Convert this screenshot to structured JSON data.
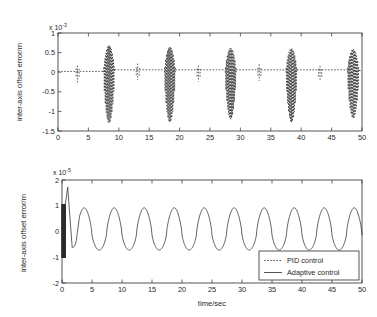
{
  "figure": {
    "background_color": "#ffffff",
    "line_color": "#2b2b2b",
    "xlabel": "time/sec"
  },
  "chart_data": [
    {
      "type": "line",
      "id": "top-subplot",
      "title": "",
      "xlabel": "",
      "ylabel": "inter-axis offset error/m",
      "y_multiplier_text": "x 10",
      "y_multiplier_exponent": "-3",
      "y_multiplier_value": 0.001,
      "xlim": [
        0,
        50
      ],
      "ylim": [
        -1.5,
        1
      ],
      "xticks": [
        0,
        5,
        10,
        15,
        20,
        25,
        30,
        35,
        40,
        45,
        50
      ],
      "xticklabels": [
        "0",
        "5",
        "10",
        "15",
        "20",
        "25",
        "30",
        "35",
        "40",
        "45",
        "50"
      ],
      "yticks": [
        1,
        0.5,
        0,
        -0.5,
        -1,
        -1.5
      ],
      "yticklabels": [
        "1",
        "0.5",
        "0",
        "-0.5",
        "-1",
        "-1.5"
      ],
      "grid": false,
      "legend": "none",
      "series": [
        {
          "name": "PID control",
          "style": "dotted",
          "description": "Near-zero dotted baseline punctuated by five large dense oscillatory bursts and five small spikes",
          "baseline": 0.02,
          "small_spikes": [
            {
              "center": 3.2,
              "half_width": 0.45,
              "top": 0.17,
              "bottom": -0.26
            },
            {
              "center": 13.1,
              "half_width": 0.45,
              "top": 0.22,
              "bottom": -0.2
            },
            {
              "center": 23.1,
              "half_width": 0.45,
              "top": 0.17,
              "bottom": -0.24
            },
            {
              "center": 33.1,
              "half_width": 0.45,
              "top": 0.2,
              "bottom": -0.22
            },
            {
              "center": 43.1,
              "half_width": 0.45,
              "top": 0.16,
              "bottom": -0.23
            }
          ],
          "bursts": [
            {
              "start": 7.5,
              "end": 9.3,
              "peak": 0.7,
              "trough": -1.3,
              "step_after": 0.06
            },
            {
              "start": 17.5,
              "end": 19.3,
              "peak": 0.66,
              "trough": -1.28,
              "step_after": 0.06
            },
            {
              "start": 27.5,
              "end": 29.3,
              "peak": 0.63,
              "trough": -1.2,
              "step_after": 0.06
            },
            {
              "start": 37.5,
              "end": 39.3,
              "peak": 0.62,
              "trough": -1.28,
              "step_after": 0.06
            },
            {
              "start": 47.6,
              "end": 49.5,
              "peak": 0.6,
              "trough": -1.18,
              "step_after": 0.04
            }
          ]
        }
      ]
    },
    {
      "type": "line",
      "id": "bottom-subplot",
      "title": "",
      "xlabel": "time/sec",
      "ylabel": "inter-axis offset error/m",
      "y_multiplier_text": "x 10",
      "y_multiplier_exponent": "-5",
      "y_multiplier_value": 1e-05,
      "xlim": [
        0,
        50
      ],
      "ylim": [
        -2,
        2
      ],
      "xticks": [
        0,
        5,
        10,
        15,
        20,
        25,
        30,
        35,
        40,
        45,
        50
      ],
      "xticklabels": [
        "0",
        "5",
        "10",
        "15",
        "20",
        "25",
        "30",
        "35",
        "40",
        "45",
        "50"
      ],
      "yticks": [
        2,
        1,
        0,
        -1,
        -2
      ],
      "yticklabels": [
        "2",
        "1",
        "0",
        "-1",
        "-2"
      ],
      "grid": false,
      "legend": "lower-right",
      "series": [
        {
          "name": "Adaptive control",
          "style": "solid",
          "description": "Fast initial transient chatter then decaying into a steady periodic oscillation of about 5 second period",
          "transient": {
            "chatter_end": 0.55,
            "chatter_top": 1.05,
            "chatter_bottom": -1.02,
            "overshoot_time": 0.95,
            "overshoot_value": 1.72,
            "undershoot_time": 1.7,
            "undershoot_value": -0.62
          },
          "steady": {
            "period": 5.0,
            "phase": 2.45,
            "amplitude_positive": 0.92,
            "amplitude_negative": -0.72,
            "offset": 0.1
          }
        }
      ]
    }
  ],
  "legend": {
    "entries": [
      {
        "label": "PID control",
        "style": "dotted"
      },
      {
        "label": "Adaptive control",
        "style": "solid"
      }
    ]
  }
}
